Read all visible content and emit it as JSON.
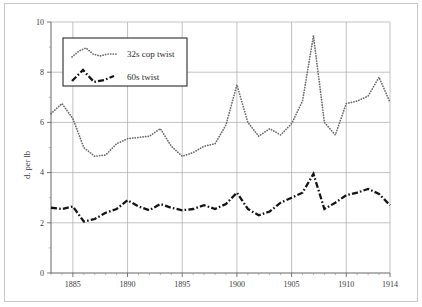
{
  "chart_data": {
    "type": "line",
    "title": "",
    "xlabel": "",
    "ylabel": "d. per lb",
    "xlim": [
      1883,
      1914
    ],
    "ylim": [
      0,
      10
    ],
    "yticks": [
      0,
      2,
      4,
      6,
      8,
      10
    ],
    "ytick_labels": [
      "0",
      "2",
      "4",
      "6",
      "8",
      "10"
    ],
    "xticks": [
      1885,
      1890,
      1895,
      1900,
      1905,
      1910,
      1914
    ],
    "xtick_labels": [
      "1885",
      "1890",
      "1895",
      "1900",
      "1905",
      "1910",
      "1914"
    ],
    "grid": true,
    "legend_position": "upper-left-inside",
    "x": [
      1883,
      1884,
      1885,
      1886,
      1887,
      1888,
      1889,
      1890,
      1891,
      1892,
      1893,
      1894,
      1895,
      1896,
      1897,
      1898,
      1899,
      1900,
      1901,
      1902,
      1903,
      1904,
      1905,
      1906,
      1907,
      1908,
      1909,
      1910,
      1911,
      1912,
      1913,
      1914
    ],
    "series": [
      {
        "name": "32s cop twist",
        "style": "dotted",
        "color": "#6b6b6b",
        "values": [
          6.35,
          6.75,
          6.15,
          5.0,
          4.65,
          4.7,
          5.15,
          5.35,
          5.4,
          5.45,
          5.75,
          5.05,
          4.65,
          4.8,
          5.05,
          5.15,
          5.9,
          7.5,
          6.0,
          5.45,
          5.75,
          5.5,
          5.95,
          6.85,
          9.45,
          6.0,
          5.5,
          6.75,
          6.85,
          7.05,
          7.8,
          6.8
        ]
      },
      {
        "name": "60s twist",
        "style": "dash-dot",
        "color": "#141414",
        "values": [
          2.6,
          2.55,
          2.65,
          2.05,
          2.15,
          2.4,
          2.55,
          2.9,
          2.65,
          2.5,
          2.75,
          2.6,
          2.5,
          2.55,
          2.7,
          2.55,
          2.75,
          3.2,
          2.55,
          2.3,
          2.45,
          2.8,
          3.0,
          3.2,
          3.95,
          2.55,
          2.8,
          3.1,
          3.2,
          3.35,
          3.15,
          2.7
        ]
      }
    ],
    "legend": [
      {
        "label": "32s cop twist",
        "style": "dotted"
      },
      {
        "label": "60s twist",
        "style": "dash-dot"
      }
    ]
  }
}
